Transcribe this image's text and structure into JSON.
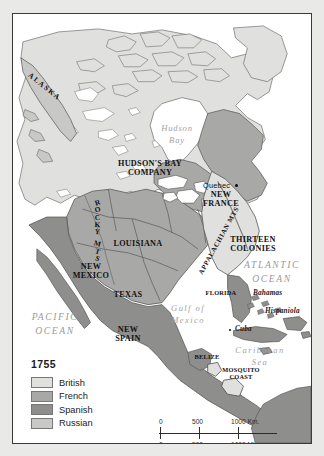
{
  "map": {
    "title_year": "1755",
    "territories": [
      {
        "name": "ALASKA",
        "power": "Russian"
      },
      {
        "name": "HUDSON'S BAY COMPANY",
        "line1": "HUDSON'S BAY",
        "line2": "COMPANY",
        "power": "British"
      },
      {
        "name": "NEW FRANCE",
        "line1": "NEW",
        "line2": "FRANCE",
        "power": "French"
      },
      {
        "name": "THIRTEEN COLONIES",
        "line1": "THIRTEEN",
        "line2": "COLONIES",
        "power": "British"
      },
      {
        "name": "LOUISIANA",
        "power": "French"
      },
      {
        "name": "NEW MEXICO",
        "line1": "NEW",
        "line2": "MEXICO",
        "power": "Spanish"
      },
      {
        "name": "TEXAS",
        "power": "Spanish"
      },
      {
        "name": "NEW SPAIN",
        "line1": "NEW",
        "line2": "SPAIN",
        "power": "Spanish"
      },
      {
        "name": "FLORIDA",
        "power": "Spanish"
      },
      {
        "name": "BELIZE",
        "power": "British"
      },
      {
        "name": "MOSQUITO COAST",
        "line1": "MOSQUITO",
        "line2": "COAST",
        "power": "British"
      }
    ],
    "mountains": [
      {
        "name": "ROCKY MTS",
        "letters": [
          "R",
          "O",
          "C",
          "K",
          "Y",
          "M",
          "T",
          "S"
        ]
      },
      {
        "name": "APPALACHIAN MTS"
      }
    ],
    "cities": [
      {
        "name": "Quebec"
      }
    ],
    "waters": [
      {
        "name": "Hudson Bay",
        "line1": "Hudson",
        "line2": "Bay"
      },
      {
        "name": "ATLANTIC OCEAN",
        "line1": "ATLANTIC",
        "line2": "OCEAN"
      },
      {
        "name": "PACIFIC OCEAN",
        "line1": "PACIFIC",
        "line2": "OCEAN"
      },
      {
        "name": "Gulf of Mexico",
        "line1": "Gulf of",
        "line2": "Mexico"
      },
      {
        "name": "Caribbean Sea",
        "line1": "Caribbean",
        "line2": "Sea"
      }
    ],
    "islands": [
      {
        "name": "Bahamas"
      },
      {
        "name": "Hispaniola"
      },
      {
        "name": "Cuba"
      }
    ]
  },
  "legend": {
    "year": "1755",
    "entries": [
      {
        "label": "British",
        "color": "#e0e0de"
      },
      {
        "label": "French",
        "color": "#a8a8a6"
      },
      {
        "label": "Spanish",
        "color": "#8e8e8c"
      },
      {
        "label": "Russian",
        "color": "#c8c8c6"
      }
    ]
  },
  "scale": {
    "km": {
      "ticks": [
        "0",
        "500",
        "1000 Km."
      ]
    },
    "mi": {
      "ticks": [
        "0",
        "500",
        "1000 Mi."
      ]
    }
  },
  "colors": {
    "british": "#e0e0de",
    "french": "#a8a8a6",
    "spanish": "#8e8e8c",
    "russian": "#c8c8c6",
    "water": "#ffffff",
    "coastline": "#4a4a4a",
    "frame": "#3b3b3b"
  }
}
